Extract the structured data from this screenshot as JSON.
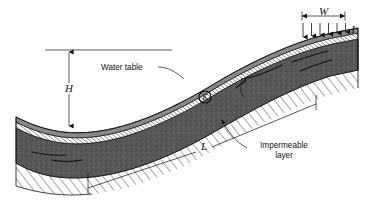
{
  "figure": {
    "domain": "engineering-diagram",
    "background_color": "#ffffff",
    "ink_color": "#111111",
    "aquifer_fill": "#5a5a5a",
    "aquifer_fill_dark": "#4a4a4a",
    "water_table_band": "#ffffff",
    "impermeable_hatch": "#2a2a2a"
  },
  "labels": {
    "width_symbol": "W",
    "infiltration_symbol": "I",
    "head_symbol": "H",
    "length_symbol": "L",
    "depth_symbol": "D",
    "conductivity_symbol": "K",
    "water_table": "Water table",
    "impermeable_line1": "Impermeable",
    "impermeable_line2": "layer"
  },
  "annotations": [
    {
      "name": "width-dimension",
      "symbol": "W",
      "description": "Horizontal dimension with end ticks over the infiltration band at top right"
    },
    {
      "name": "infiltration-arrows",
      "symbol": "I",
      "count": 6,
      "direction": "down",
      "description": "Vertical downward arrows indicating infiltration rate onto the ground surface"
    },
    {
      "name": "head-dimension",
      "symbol": "H",
      "orientation": "vertical",
      "description": "Vertical double-headed dimension from ground datum line down to low water table"
    },
    {
      "name": "length-dimension",
      "symbol": "L",
      "orientation": "diagonal",
      "description": "Diagonal dimension along the impermeable layer spanning the aquifer length"
    },
    {
      "name": "water-table-callout",
      "symbol": "Water table",
      "description": "Leader line pointing to the hatched phreatic surface band"
    },
    {
      "name": "impermeable-callout",
      "symbol": "Impermeable layer",
      "description": "Leader line pointing to the hatched base beneath the aquifer"
    },
    {
      "name": "conductivity-marker",
      "symbol": "K",
      "description": "Circled K marking hydraulic conductivity within the saturated zone"
    },
    {
      "name": "depth-marker",
      "symbol": "D",
      "description": "Aquifer saturated thickness marker"
    }
  ],
  "infiltration_arrow_count": 6
}
